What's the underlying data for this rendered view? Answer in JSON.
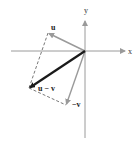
{
  "diagram": {
    "axes": {
      "x_label": "x",
      "y_label": "y",
      "origin": [
        85,
        51
      ],
      "x_range_px": [
        11,
        126
      ],
      "y_range_px": [
        12,
        138
      ]
    },
    "vectors": [
      {
        "name": "u",
        "label": "u",
        "tip": [
          48,
          33
        ],
        "style": "gray",
        "color": "#9a9a9a"
      },
      {
        "name": "-v",
        "label": "−v",
        "tip": [
          66,
          105
        ],
        "style": "gray",
        "color": "#9a9a9a"
      },
      {
        "name": "u-v",
        "label": "u − v",
        "tip": [
          29,
          88
        ],
        "style": "bold",
        "color": "#1a1a1a"
      }
    ],
    "dashed_edges": [
      {
        "from": [
          48,
          33
        ],
        "to": [
          29,
          88
        ]
      },
      {
        "from": [
          29,
          88
        ],
        "to": [
          66,
          105
        ]
      }
    ],
    "colors": {
      "axis": "#9a9a9a",
      "vector_gray": "#9a9a9a",
      "vector_bold": "#1a1a1a",
      "dashed": "#555555"
    }
  }
}
